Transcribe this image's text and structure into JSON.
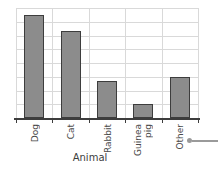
{
  "chart_data": {
    "type": "bar",
    "title": "",
    "xlabel": "Animal",
    "ylabel": "",
    "categories": [
      "Dog",
      "Cat",
      "Rabbit",
      "Guinea pig",
      "Other"
    ],
    "category_lines": [
      [
        "Dog"
      ],
      [
        "Cat"
      ],
      [
        "Rabbit"
      ],
      [
        "Guinea",
        "pig"
      ],
      [
        "Other"
      ]
    ],
    "values": [
      7.5,
      6.3,
      2.7,
      1.0,
      3.0
    ],
    "ylim": [
      0,
      8
    ],
    "grid": true,
    "gridlines_horizontal": 8,
    "y_tick_labels": [],
    "legend": "none",
    "bar_fill_color": "#8c8c8c",
    "bar_edge_color": "#3d3d3d",
    "grid_color": "#d9d9d9",
    "axis_color": "#3d3d3d"
  },
  "annotation": {
    "marker_color": "#9a9a9a",
    "marker_label": ""
  }
}
